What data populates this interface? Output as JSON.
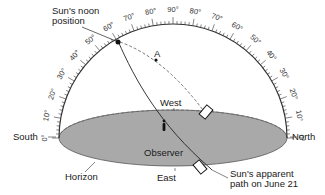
{
  "labels": {
    "noon_line1": "Sun's noon",
    "noon_line2": "position",
    "point_a": "A",
    "west": "West",
    "east": "East",
    "observer": "Observer",
    "south": "South",
    "north": "North",
    "horizon": "Horizon",
    "path_line1": "Sun's apparent",
    "path_line2": "path on June 21"
  },
  "scale": {
    "left_ticks": [
      "0°",
      "10°",
      "20°",
      "30°",
      "40°",
      "50°",
      "60°",
      "70°",
      "80°"
    ],
    "top": "90°",
    "right_ticks": [
      "80°",
      "70°",
      "60°",
      "50°",
      "40°",
      "30°",
      "20°",
      "10°",
      "0°"
    ]
  },
  "colors": {
    "horizon_fill": "#a9a9a9",
    "line": "#222222"
  }
}
